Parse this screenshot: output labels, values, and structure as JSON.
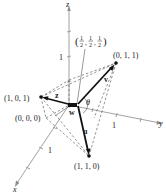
{
  "figure": {
    "axes": {
      "x_label": "x",
      "y_label": "y",
      "z_label": "z",
      "x_tick": "1",
      "y_tick": "1",
      "z_tick": "1"
    },
    "points": {
      "origin": "(0, 0, 0)",
      "p101": "(1, 0, 1)",
      "p011": "(0, 1, 1)",
      "p110": "(1, 1, 0)"
    },
    "center_point": {
      "open": "(",
      "half": "1",
      "den": "2",
      "sep": ",",
      "close": ")"
    },
    "vectors": {
      "u": "u",
      "v": "v",
      "w": "w",
      "z": "z"
    },
    "angle": "θ",
    "colors": {
      "vector": "#111111",
      "axis": "#8a8a8a",
      "dashed": "#666666"
    }
  }
}
